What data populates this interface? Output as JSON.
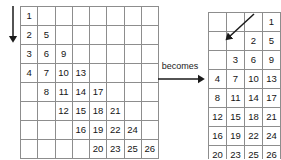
{
  "diagram": {
    "connector": {
      "label": "becomes",
      "arrow": "right-arrow-icon"
    },
    "left_panel": {
      "name": "original-grid",
      "columns": 8,
      "rows": 8,
      "direction_arrow": "down-arrow-icon",
      "cells": [
        [
          "1",
          "",
          "",
          "",
          "",
          "",
          "",
          ""
        ],
        [
          "2",
          "5",
          "",
          "",
          "",
          "",
          "",
          ""
        ],
        [
          "3",
          "6",
          "9",
          "",
          "",
          "",
          "",
          ""
        ],
        [
          "4",
          "7",
          "10",
          "13",
          "",
          "",
          "",
          ""
        ],
        [
          "",
          "8",
          "11",
          "14",
          "17",
          "",
          "",
          ""
        ],
        [
          "",
          "",
          "12",
          "15",
          "18",
          "21",
          "",
          ""
        ],
        [
          "",
          "",
          "",
          "16",
          "19",
          "22",
          "24",
          ""
        ],
        [
          "",
          "",
          "",
          "",
          "20",
          "23",
          "25",
          "26"
        ]
      ]
    },
    "right_panel": {
      "name": "transformed-grid",
      "columns": 4,
      "rows": 8,
      "direction_arrow": "diagonal-down-left-arrow-icon",
      "cells": [
        [
          "",
          "",
          "",
          "1"
        ],
        [
          "",
          "",
          "2",
          "5"
        ],
        [
          "",
          "3",
          "6",
          "9"
        ],
        [
          "4",
          "7",
          "10",
          "13"
        ],
        [
          "8",
          "11",
          "14",
          "17"
        ],
        [
          "12",
          "15",
          "18",
          "21"
        ],
        [
          "16",
          "19",
          "22",
          "24"
        ],
        [
          "20",
          "23",
          "25",
          "26"
        ]
      ]
    }
  },
  "colors": {
    "background": "#ffffff",
    "grid_line": "#8d8d8d",
    "text": "#141414",
    "arrow": "#1a1a1a"
  }
}
